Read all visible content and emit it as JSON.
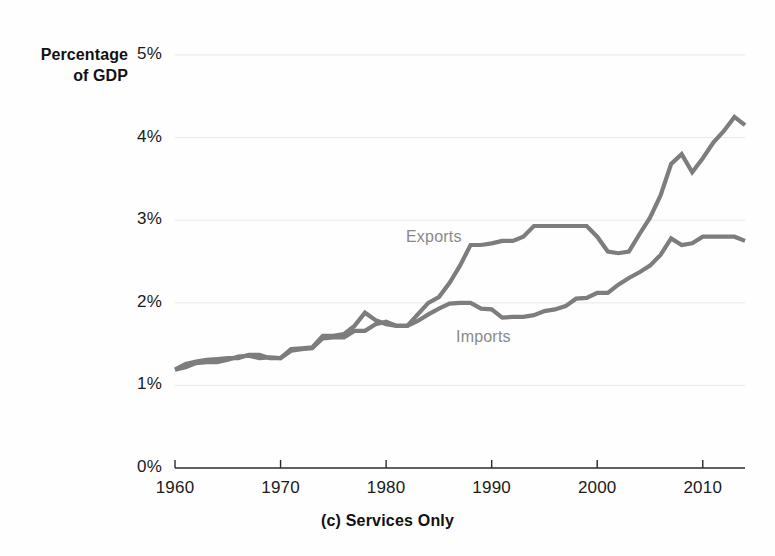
{
  "axis_title": {
    "line1": "Percentage",
    "line2": "of GDP"
  },
  "caption": "(c) Services Only",
  "series_labels": {
    "exports": "Exports",
    "imports": "Imports"
  },
  "ytick_labels": [
    "5%",
    "4%",
    "3%",
    "2%",
    "1%",
    "0%"
  ],
  "xtick_labels": [
    "1960",
    "1970",
    "1980",
    "1990",
    "2000",
    "2010"
  ],
  "colors": {
    "line": "#7d7d7d",
    "axis": "#2b2b2b",
    "grid": "#e8e8e8",
    "label_text": "#8a8a8a",
    "tick_text": "#1a1a1a"
  },
  "chart_data": {
    "type": "line",
    "title": "(c) Services Only",
    "xlabel": "",
    "ylabel": "Percentage of GDP",
    "xlim": [
      1960,
      2014
    ],
    "ylim": [
      0,
      5
    ],
    "yticks": [
      0,
      1,
      2,
      3,
      4,
      5
    ],
    "ytick_labels": [
      "0%",
      "1%",
      "2%",
      "3%",
      "4%",
      "5%"
    ],
    "xticks": [
      1960,
      1970,
      1980,
      1990,
      2000,
      2010
    ],
    "grid": true,
    "legend": "inline-annotations",
    "annotations": [
      {
        "text": "Exports",
        "x": 1988,
        "y": 2.85
      },
      {
        "text": "Imports",
        "x": 1993,
        "y": 1.62
      }
    ],
    "x": [
      1960,
      1961,
      1962,
      1963,
      1964,
      1965,
      1966,
      1967,
      1968,
      1969,
      1970,
      1971,
      1972,
      1973,
      1974,
      1975,
      1976,
      1977,
      1978,
      1979,
      1980,
      1981,
      1982,
      1983,
      1984,
      1985,
      1986,
      1987,
      1988,
      1989,
      1990,
      1991,
      1992,
      1993,
      1994,
      1995,
      1996,
      1997,
      1998,
      1999,
      2000,
      2001,
      2002,
      2003,
      2004,
      2005,
      2006,
      2007,
      2008,
      2009,
      2010,
      2011,
      2012,
      2013,
      2014
    ],
    "series": [
      {
        "name": "Exports",
        "values": [
          1.19,
          1.26,
          1.29,
          1.31,
          1.32,
          1.33,
          1.33,
          1.37,
          1.37,
          1.33,
          1.33,
          1.44,
          1.45,
          1.46,
          1.6,
          1.6,
          1.62,
          1.72,
          1.88,
          1.79,
          1.74,
          1.72,
          1.72,
          1.86,
          2.0,
          2.07,
          2.24,
          2.45,
          2.7,
          2.7,
          2.72,
          2.75,
          2.75,
          2.8,
          2.93,
          2.93,
          2.93,
          2.93,
          2.93,
          2.93,
          2.8,
          2.62,
          2.6,
          2.62,
          2.83,
          3.03,
          3.3,
          3.68,
          3.8,
          3.58,
          3.75,
          3.94,
          4.08,
          4.25,
          4.15
        ]
      },
      {
        "name": "Imports",
        "values": [
          1.19,
          1.22,
          1.27,
          1.28,
          1.28,
          1.31,
          1.35,
          1.36,
          1.33,
          1.34,
          1.33,
          1.42,
          1.44,
          1.45,
          1.57,
          1.58,
          1.58,
          1.66,
          1.66,
          1.74,
          1.77,
          1.72,
          1.72,
          1.78,
          1.86,
          1.93,
          1.99,
          2.0,
          2.0,
          1.93,
          1.92,
          1.82,
          1.83,
          1.83,
          1.85,
          1.9,
          1.92,
          1.96,
          2.05,
          2.06,
          2.12,
          2.12,
          2.22,
          2.3,
          2.37,
          2.45,
          2.58,
          2.78,
          2.7,
          2.72,
          2.8,
          2.8,
          2.8,
          2.8,
          2.75
        ]
      }
    ]
  },
  "plot_geometry": {
    "x_left_px": 175,
    "x_right_px": 745,
    "y_zero_px": 468,
    "y_per_unit_px": 82.6
  }
}
